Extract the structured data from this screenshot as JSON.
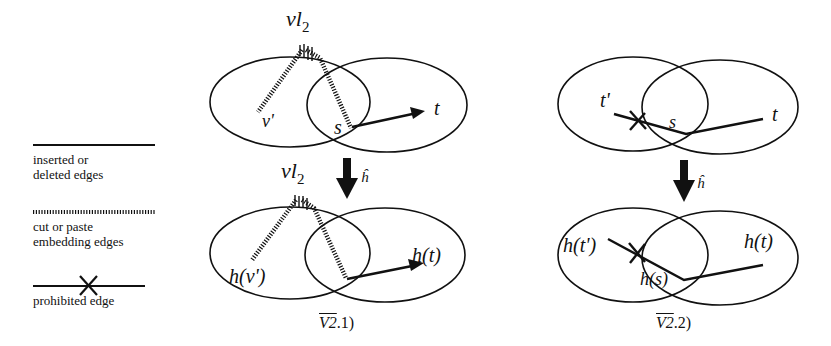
{
  "legend": {
    "items": [
      {
        "line_style": "solid",
        "label_line1": "inserted or",
        "label_line2": "deleted edges"
      },
      {
        "line_style": "hatched",
        "label_line1": "cut or paste",
        "label_line2": "embedding edges"
      },
      {
        "line_style": "solid-crossed",
        "label_line1": "prohibited edge",
        "label_line2": ""
      }
    ]
  },
  "diagram_1": {
    "caption_bar": "V2",
    "caption_rest": ".1)",
    "top": {
      "apex_label_main": "vl",
      "apex_label_sub": "2",
      "node_v_prime": "v'",
      "node_s": "s",
      "node_t": "t"
    },
    "mapping_label": "ĥ",
    "bottom": {
      "apex_label_main": "vl",
      "apex_label_sub": "2",
      "node_v_prime": "h(v')",
      "node_t": "h(t)"
    }
  },
  "diagram_2": {
    "caption_bar": "V2",
    "caption_rest": ".2)",
    "top": {
      "node_t_prime": "t'",
      "node_s": "s",
      "node_t": "t"
    },
    "mapping_label": "ĥ",
    "bottom": {
      "node_t_prime": "h(t')",
      "node_s": "h(s)",
      "node_t": "h(t)"
    }
  },
  "colors": {
    "ink": "#111111",
    "background": "#ffffff"
  }
}
